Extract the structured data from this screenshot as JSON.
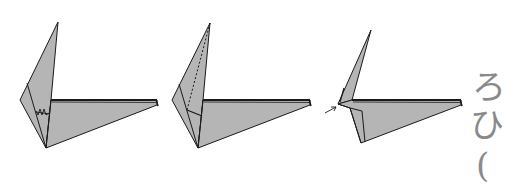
{
  "diagram": {
    "type": "origami-folding-steps",
    "steps": [
      {
        "id": 1,
        "marks": "valley-fold-crease with zigzag (crimp) symbol"
      },
      {
        "id": 2,
        "marks": "dotted fold line from apex"
      },
      {
        "id": 3,
        "marks": "arrow pointing to inner fold"
      }
    ],
    "colors": {
      "paper": "#b5b5b5",
      "line": "#1a1a1a",
      "glyph": "#8a8a8a"
    },
    "edge_glyphs": [
      "ろ",
      "ひ",
      "("
    ]
  }
}
